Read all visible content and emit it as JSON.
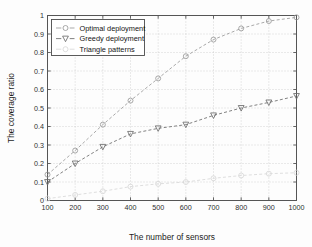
{
  "chart_data": {
    "type": "line",
    "title": "",
    "xlabel": "The number of sensors",
    "ylabel": "The coverage ratio",
    "x": [
      100,
      200,
      300,
      400,
      500,
      600,
      700,
      800,
      900,
      1000
    ],
    "xticklabels": [
      "100",
      "200",
      "300",
      "400",
      "500",
      "600",
      "700",
      "800",
      "900",
      "1000"
    ],
    "yticklabels": [
      "0",
      "0.1",
      "0.2",
      "0.3",
      "0.4",
      "0.5",
      "0.6",
      "0.7",
      "0.8",
      "0.9",
      "1"
    ],
    "xlim": [
      100,
      1000
    ],
    "ylim": [
      0,
      1
    ],
    "grid": true,
    "legend_position": "upper left",
    "series": [
      {
        "name": "Optimal deployment",
        "marker": "circle",
        "linestyle": "dashed",
        "color": "#9a9a9a",
        "values": [
          0.14,
          0.27,
          0.41,
          0.54,
          0.66,
          0.78,
          0.87,
          0.93,
          0.97,
          0.99
        ]
      },
      {
        "name": "Greedy deployment",
        "marker": "triangle-down",
        "linestyle": "dashed",
        "color": "#6b6b6b",
        "values": [
          0.1,
          0.2,
          0.29,
          0.36,
          0.39,
          0.41,
          0.46,
          0.5,
          0.53,
          0.565
        ]
      },
      {
        "name": "Triangle patterns",
        "marker": "circle",
        "linestyle": "dashed",
        "color": "#d8d8d8",
        "values": [
          0.01,
          0.03,
          0.05,
          0.075,
          0.09,
          0.1,
          0.12,
          0.135,
          0.145,
          0.15
        ]
      }
    ]
  },
  "legend": {
    "items": [
      {
        "label": "Optimal deployment"
      },
      {
        "label": "Greedy deployment"
      },
      {
        "label": "Triangle patterns"
      }
    ]
  },
  "colors": {
    "axis": "#555555",
    "grid": "#bdbdbd",
    "background": "#fdfdfd",
    "optimal": "#9a9a9a",
    "greedy": "#6b6b6b",
    "triangle": "#d8d8d8"
  }
}
